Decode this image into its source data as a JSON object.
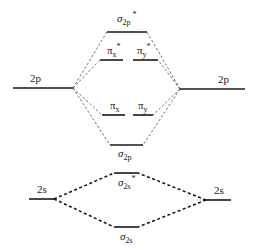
{
  "diagram": {
    "title": "",
    "atomic_orbitals": {
      "left_2p": {
        "label": "2p",
        "x1": 13,
        "x2": 73,
        "y": 88
      },
      "right_2p": {
        "label": "2p",
        "x1": 180,
        "x2": 245,
        "y": 89
      },
      "left_2s": {
        "label": "2s",
        "x1": 29,
        "x2": 54,
        "y": 199
      },
      "right_2s": {
        "label": "2s",
        "x1": 206,
        "x2": 231,
        "y": 200
      }
    },
    "molecular_orbitals": {
      "sigma2p_star": {
        "symbol": "σ",
        "sub": "2p",
        "sup": "*",
        "x1": 107,
        "x2": 147,
        "y": 32
      },
      "pix_star": {
        "symbol": "π",
        "sub": "x",
        "sup": "*",
        "x1": 100,
        "x2": 123,
        "y": 60
      },
      "piy_star": {
        "symbol": "π",
        "sub": "y",
        "sup": "*",
        "x1": 133,
        "x2": 158,
        "y": 60
      },
      "pix": {
        "symbol": "π",
        "sub": "x",
        "sup": "",
        "x1": 102,
        "x2": 125,
        "y": 115
      },
      "piy": {
        "symbol": "π",
        "sub": "y",
        "sup": "",
        "x1": 133,
        "x2": 153,
        "y": 115
      },
      "sigma2p": {
        "symbol": "σ",
        "sub": "2p",
        "sup": "",
        "x1": 110,
        "x2": 143,
        "y": 145
      },
      "sigma2s_star": {
        "symbol": "σ",
        "sub": "2s",
        "sup": "*",
        "x1": 114,
        "x2": 138,
        "y": 173
      },
      "sigma2s": {
        "symbol": "σ",
        "sub": "2s",
        "sup": "",
        "x1": 114,
        "x2": 138,
        "y": 227
      }
    },
    "colors": {
      "line": "#1a1a1a",
      "text": "#222222",
      "background": "#ffffff"
    }
  }
}
